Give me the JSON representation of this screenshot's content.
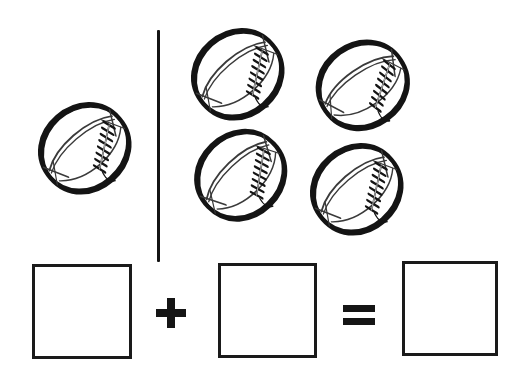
{
  "page": {
    "kind": "math-worksheet",
    "title": "Football Addition Problem",
    "width": 510,
    "height": 375,
    "background_color": "#ffffff",
    "ink_color": "#151515"
  },
  "divider": {
    "name": "vertical-divider",
    "orientation": "vertical",
    "x": 157,
    "y": 30,
    "length": 232,
    "thickness": 3,
    "color": "#141414"
  },
  "groups": [
    {
      "id": "left-group",
      "label": "Left group",
      "count": 1,
      "items": [
        {
          "id": "ball-1",
          "label": "football",
          "x": 33,
          "y": 101,
          "w": 103,
          "h": 95,
          "rotation": -41
        }
      ]
    },
    {
      "id": "right-group",
      "label": "Right group",
      "count": 4,
      "items": [
        {
          "id": "ball-2",
          "label": "football",
          "x": 186,
          "y": 27,
          "w": 103,
          "h": 95,
          "rotation": -41
        },
        {
          "id": "ball-3",
          "label": "football",
          "x": 311,
          "y": 38,
          "w": 103,
          "h": 95,
          "rotation": -35
        },
        {
          "id": "ball-4",
          "label": "football",
          "x": 189,
          "y": 128,
          "w": 103,
          "h": 95,
          "rotation": -44
        },
        {
          "id": "ball-5",
          "label": "football",
          "x": 305,
          "y": 142,
          "w": 103,
          "h": 95,
          "rotation": -41
        }
      ]
    }
  ],
  "equation": {
    "label": "addition equation",
    "expression": "1 + 4 = 5",
    "addend_1": 1,
    "addend_2": 4,
    "sum": 5,
    "boxes": [
      {
        "id": "box-addend-1",
        "label": "first addend box",
        "value": "",
        "x": 32,
        "y": 264,
        "w": 100,
        "h": 95
      },
      {
        "id": "box-addend-2",
        "label": "second addend box",
        "value": "",
        "x": 218,
        "y": 263,
        "w": 99,
        "h": 95
      },
      {
        "id": "box-sum",
        "label": "sum box",
        "value": "",
        "x": 402,
        "y": 261,
        "w": 96,
        "h": 95
      }
    ],
    "operators": [
      {
        "id": "op-plus",
        "label": "plus sign",
        "symbol": "+",
        "x": 156,
        "y": 298
      },
      {
        "id": "op-equals",
        "label": "equals sign",
        "symbol": "=",
        "x": 343,
        "y": 305
      }
    ]
  },
  "football_art": {
    "name": "american-football",
    "description": "hand-drawn outline of an american football with seam lines and laces",
    "outline_color": "#141414",
    "seam_color": "#3a3a3a",
    "lace_color": "#141414",
    "fill_color": "#ffffff"
  }
}
